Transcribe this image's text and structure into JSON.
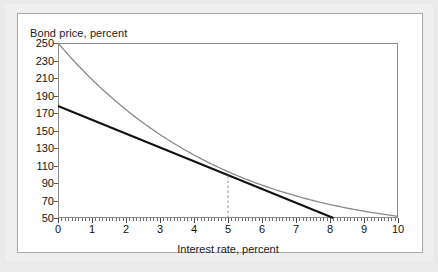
{
  "figure": {
    "panel_background": "#ffffff",
    "outer_background": "#eaeaea",
    "border_color": "#a8a8a8"
  },
  "chart_data": {
    "type": "line",
    "title": "",
    "ytitle": "Bond price, percent",
    "xlabel": "Interest rate, percent",
    "ylabel": "Bond price, percent",
    "xlim": [
      0,
      10
    ],
    "ylim": [
      50,
      250
    ],
    "grid": false,
    "legend_position": "none",
    "xticks": [
      0,
      1,
      2,
      3,
      4,
      5,
      6,
      7,
      8,
      9,
      10
    ],
    "xtick_labels": [
      "0",
      "1",
      "2",
      "3",
      "4",
      "5",
      "6",
      "7",
      "8",
      "9",
      "10"
    ],
    "minor_xticks_per_interval": 10,
    "yticks": [
      50,
      70,
      90,
      110,
      130,
      150,
      170,
      190,
      210,
      230,
      250
    ],
    "ytick_labels": [
      "50",
      "70",
      "90",
      "110",
      "130",
      "150",
      "170",
      "190",
      "210",
      "230",
      "250"
    ],
    "x": [
      0,
      0.5,
      1,
      1.5,
      2,
      2.5,
      3,
      3.5,
      4,
      4.5,
      5,
      5.5,
      6,
      6.5,
      7,
      7.5,
      8,
      8.5,
      9,
      9.5,
      10
    ],
    "series": [
      {
        "name": "Bond price curve",
        "color": "#8a8a8a",
        "width": 1.3,
        "style": "solid",
        "values": [
          250,
          231,
          213,
          197,
          182,
          169,
          156,
          145,
          134,
          125,
          100,
          108,
          101,
          94,
          88,
          82,
          77,
          71,
          66,
          60,
          52
        ]
      },
      {
        "name": "Tangent (duration) line",
        "color": "#111111",
        "width": 2.0,
        "style": "solid",
        "x_end": 8.1,
        "values": [
          178,
          170,
          162,
          154,
          146,
          138,
          131,
          123,
          115,
          107,
          100,
          92,
          84,
          76,
          68,
          61,
          53,
          null,
          null,
          null,
          null
        ]
      }
    ],
    "annotations": [
      {
        "name": "tangency-marker",
        "type": "vertical-dashed-line",
        "x": 5,
        "y_from": 50,
        "y_to": 100,
        "color": "#8a8a8a"
      }
    ]
  }
}
